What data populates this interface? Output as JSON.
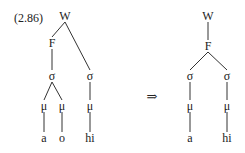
{
  "example_label": "(2.86)",
  "arrow": "⇒",
  "before_tree": {
    "nodes": [
      {
        "id": "W",
        "label": "W"
      },
      {
        "id": "F",
        "label": "F"
      },
      {
        "id": "s1",
        "label": "σ"
      },
      {
        "id": "s2",
        "label": "σ"
      },
      {
        "id": "m1",
        "label": "μ"
      },
      {
        "id": "m2",
        "label": "μ"
      },
      {
        "id": "m3",
        "label": "μ"
      },
      {
        "id": "t1",
        "label": "a"
      },
      {
        "id": "t2",
        "label": "o"
      },
      {
        "id": "t3",
        "label": "hi"
      }
    ],
    "edges": [
      [
        "W",
        "F"
      ],
      [
        "W",
        "s2"
      ],
      [
        "F",
        "s1"
      ],
      [
        "s1",
        "m1"
      ],
      [
        "s1",
        "m2"
      ],
      [
        "s2",
        "m3"
      ],
      [
        "m1",
        "t1"
      ],
      [
        "m2",
        "t2"
      ],
      [
        "m3",
        "t3"
      ]
    ]
  },
  "after_tree": {
    "nodes": [
      {
        "id": "W",
        "label": "W"
      },
      {
        "id": "F",
        "label": "F"
      },
      {
        "id": "s1",
        "label": "σ"
      },
      {
        "id": "s2",
        "label": "σ"
      },
      {
        "id": "m1",
        "label": "μ"
      },
      {
        "id": "m2",
        "label": "μ"
      },
      {
        "id": "t1",
        "label": "a"
      },
      {
        "id": "t2",
        "label": "hi"
      }
    ],
    "edges": [
      [
        "W",
        "F"
      ],
      [
        "F",
        "s1"
      ],
      [
        "F",
        "s2"
      ],
      [
        "s1",
        "m1"
      ],
      [
        "s2",
        "m2"
      ],
      [
        "m1",
        "t1"
      ],
      [
        "m2",
        "t2"
      ]
    ]
  }
}
